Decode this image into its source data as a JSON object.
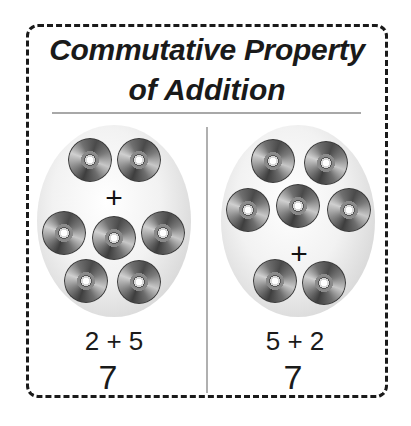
{
  "title": {
    "line1": "Commutative Property",
    "line2": "of Addition"
  },
  "panels": [
    {
      "top_group_count": 2,
      "bottom_group_count": 5,
      "operator": "+",
      "equation": "2 + 5",
      "sum": "7",
      "icon": "cd-disc-icon"
    },
    {
      "top_group_count": 5,
      "bottom_group_count": 2,
      "operator": "+",
      "equation": "5 + 2",
      "sum": "7",
      "icon": "cd-disc-icon"
    }
  ],
  "colors": {
    "border": "#1a1a1a",
    "divider": "#a8a8a8",
    "oval_edge": "#c2c2c2",
    "text": "#1a1a1a"
  }
}
